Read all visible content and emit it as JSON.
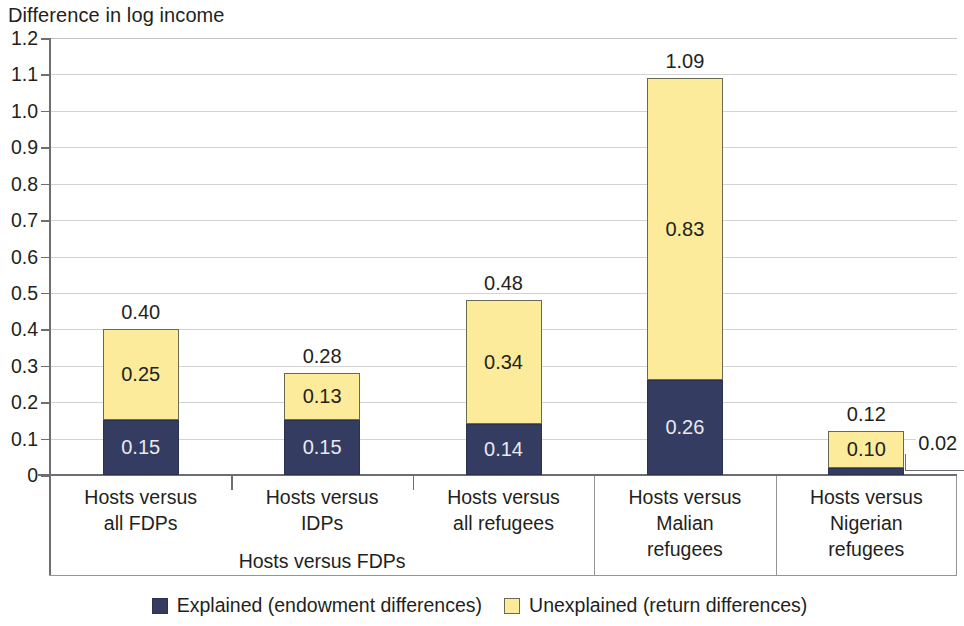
{
  "chart_data": {
    "type": "bar",
    "subtype": "stacked-bar",
    "title": "Difference in log income",
    "xlabel": "",
    "ylabel": "Difference in log income",
    "ylim": [
      0,
      1.2
    ],
    "ytick_labels": [
      "1.2",
      "1.1",
      "1.0",
      "0.9",
      "0.8",
      "0.7",
      "0.6",
      "0.5",
      "0.4",
      "0.3",
      "0.2",
      "0.1",
      "0"
    ],
    "ytick_values": [
      1.2,
      1.1,
      1.0,
      0.9,
      0.8,
      0.7,
      0.6,
      0.5,
      0.4,
      0.3,
      0.2,
      0.1,
      0
    ],
    "grid": true,
    "legend_position": "bottom",
    "categories": [
      "Hosts versus all FDPs",
      "Hosts versus IDPs",
      "Hosts versus all refugees",
      "Hosts versus Malian refugees",
      "Hosts versus Nigerian refugees"
    ],
    "series": [
      {
        "name": "Explained (endowment differences)",
        "color": "#353c61",
        "values": [
          0.15,
          0.15,
          0.14,
          0.26,
          0.02
        ],
        "value_labels": [
          "0.15",
          "0.15",
          "0.14",
          "0.26",
          "0.02"
        ]
      },
      {
        "name": "Unexplained (return differences)",
        "color": "#fbeb9a",
        "values": [
          0.25,
          0.13,
          0.34,
          0.83,
          0.1
        ],
        "value_labels": [
          "0.25",
          "0.13",
          "0.34",
          "0.83",
          "0.10"
        ]
      }
    ],
    "totals": [
      0.4,
      0.28,
      0.48,
      1.09,
      0.12
    ],
    "total_labels": [
      "0.40",
      "0.28",
      "0.48",
      "1.09",
      "0.12"
    ],
    "group_label": "Hosts versus FDPs",
    "group_label_span_categories": [
      0,
      1,
      2
    ]
  },
  "categories_display": [
    {
      "lines": [
        "Hosts versus",
        "all FDPs"
      ]
    },
    {
      "lines": [
        "Hosts versus",
        "IDPs"
      ]
    },
    {
      "lines": [
        "Hosts versus",
        "all refugees"
      ]
    },
    {
      "lines": [
        "Hosts versus",
        "Malian",
        "refugees"
      ]
    },
    {
      "lines": [
        "Hosts versus",
        "Nigerian",
        "refugees"
      ]
    }
  ],
  "legend": {
    "items": [
      {
        "label": "Explained (endowment differences)",
        "color": "#353c61"
      },
      {
        "label": "Unexplained (return differences)",
        "color": "#fbeb9a"
      }
    ]
  },
  "colors": {
    "explained": "#353c61",
    "unexplained": "#fbeb9a",
    "axis": "#6d6e71",
    "gridline": "#d2d3d5",
    "text": "#231f20"
  }
}
